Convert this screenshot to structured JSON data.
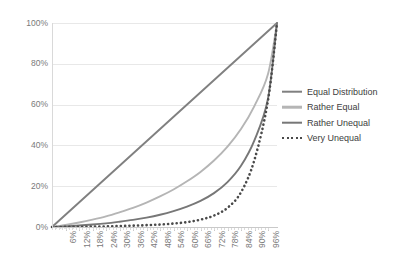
{
  "chart_data": {
    "type": "line",
    "title": "",
    "xlabel": "",
    "ylabel": "",
    "xlim": [
      0,
      100
    ],
    "ylim": [
      0,
      100
    ],
    "grid": true,
    "legend_position": "right",
    "y_ticks": [
      "0%",
      "20%",
      "40%",
      "60%",
      "80%",
      "100%"
    ],
    "y_tick_values": [
      0,
      20,
      40,
      60,
      80,
      100
    ],
    "categories": [
      "6%",
      "12%",
      "18%",
      "24%",
      "30%",
      "36%",
      "42%",
      "48%",
      "54%",
      "60%",
      "66%",
      "72%",
      "78%",
      "84%",
      "90%",
      "96%"
    ],
    "x": [
      6,
      12,
      18,
      24,
      30,
      36,
      42,
      48,
      54,
      60,
      66,
      72,
      78,
      84,
      90,
      96
    ],
    "series": [
      {
        "name": "Equal Distribution",
        "color": "#808080",
        "style": "solid",
        "values": [
          6,
          12,
          18,
          24,
          30,
          36,
          42,
          48,
          54,
          60,
          66,
          72,
          78,
          84,
          90,
          96
        ]
      },
      {
        "name": "Rather Equal",
        "color": "#b5b5b5",
        "style": "solid",
        "values": [
          1,
          2.2,
          3.6,
          5.2,
          7.2,
          9.4,
          12,
          15,
          18.4,
          22.4,
          27,
          32.6,
          39.4,
          48,
          59.4,
          75
        ]
      },
      {
        "name": "Rather Unequal",
        "color": "#777777",
        "style": "solid",
        "values": [
          0.3,
          0.7,
          1.2,
          1.8,
          2.6,
          3.5,
          4.6,
          6,
          7.8,
          10,
          12.8,
          16.6,
          22,
          30,
          42.6,
          63
        ]
      },
      {
        "name": "Very Unequal",
        "color": "#4a4a4a",
        "style": "dotted",
        "values": [
          0.05,
          0.1,
          0.2,
          0.3,
          0.45,
          0.65,
          0.9,
          1.2,
          1.7,
          2.4,
          3.6,
          5.6,
          9.4,
          17,
          33,
          62
        ]
      }
    ]
  },
  "legend": {
    "items": [
      {
        "label": "Equal Distribution"
      },
      {
        "label": "Rather Equal"
      },
      {
        "label": "Rather Unequal"
      },
      {
        "label": "Very Unequal"
      }
    ]
  }
}
